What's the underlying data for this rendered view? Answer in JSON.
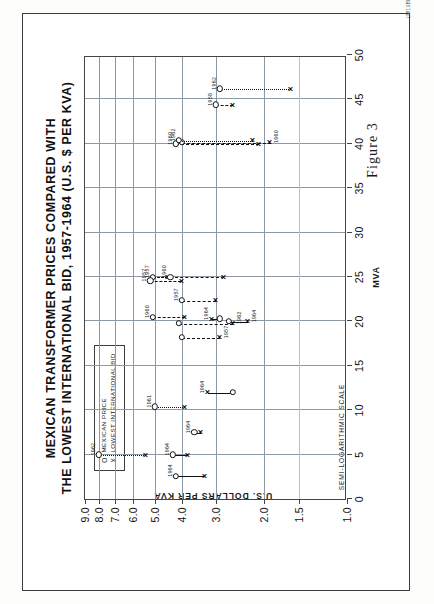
{
  "figure": {
    "caption": "Figure 3",
    "plate_code": "(281)IBRD-3478",
    "note": "SEMI-LOGARITHMIC SCALE"
  },
  "chart_data": {
    "type": "scatter",
    "title": "MEXICAN TRANSFORMER PRICES COMPARED WITH",
    "title_line2": "THE LOWEST INTERNATIONAL BID, 1957-1964 (U.S. $ PER KVA)",
    "xlabel": "MVA",
    "ylabel": "U.S. DOLLARS PER KVA",
    "xlim": [
      0,
      50
    ],
    "ylim": [
      1.0,
      9.0
    ],
    "yscale": "log",
    "grid": true,
    "xticks": [
      0,
      5,
      10,
      15,
      20,
      25,
      30,
      35,
      40,
      45,
      50
    ],
    "xticklabels": [
      "0",
      "5",
      "10",
      "15",
      "20",
      "25",
      "30",
      "35",
      "40",
      "45",
      "50"
    ],
    "yticks": [
      1.0,
      1.5,
      2.0,
      3.0,
      4.0,
      5.0,
      6.0,
      7.0,
      8.0,
      9.0
    ],
    "yticklabels": [
      "1.0",
      "1.5",
      "2.0",
      "3.0",
      "4.0",
      "5.0",
      "6.0",
      "7.0",
      "8.0",
      "9.0"
    ],
    "legend": {
      "position": "upper-left-inset",
      "entries": [
        {
          "symbol": "O",
          "label": "MEXICAN PRICE"
        },
        {
          "symbol": "X",
          "label": "LOWEST INTERNATIONAL BID"
        }
      ]
    },
    "series": [
      {
        "name": "MEXICAN PRICE",
        "marker": "O"
      },
      {
        "name": "LOWEST INTERNATIONAL BID",
        "marker": "X"
      }
    ],
    "pairs": [
      {
        "year": "1962",
        "mva": 5.0,
        "mexican_price": 8.0,
        "lowest_bid": 5.4,
        "line": "dot",
        "label_side": "above"
      },
      {
        "year": "1964",
        "mva": 2.6,
        "mexican_price": 4.2,
        "lowest_bid": 3.3,
        "line": "solid",
        "label_side": "above"
      },
      {
        "year": "1964",
        "mva": 5.0,
        "mexican_price": 4.3,
        "lowest_bid": 3.8,
        "line": "solid",
        "label_side": "above"
      },
      {
        "year": "1964",
        "mva": 7.5,
        "mexican_price": 3.6,
        "lowest_bid": 3.4,
        "line": "solid",
        "label_side": "above"
      },
      {
        "year": "1961",
        "mva": 10.4,
        "mexican_price": 5.0,
        "lowest_bid": 3.9,
        "line": "dot",
        "label_side": "above"
      },
      {
        "year": "1964",
        "mva": 12.0,
        "mexican_price": 2.6,
        "lowest_bid": 3.2,
        "line": "solid",
        "label_side": "above"
      },
      {
        "year": "1957",
        "mva": 18.2,
        "mexican_price": 4.0,
        "lowest_bid": 2.9,
        "line": "dash",
        "label_side": "below"
      },
      {
        "year": "1962",
        "mva": 19.8,
        "mexican_price": 4.1,
        "lowest_bid": 2.6,
        "line": "dash",
        "label_side": "below"
      },
      {
        "year": "1960",
        "mva": 20.5,
        "mexican_price": 5.1,
        "lowest_bid": 3.9,
        "line": "dash",
        "label_side": "above"
      },
      {
        "year": "1964",
        "mva": 20.3,
        "mexican_price": 2.9,
        "lowest_bid": 3.1,
        "line": "solid",
        "label_side": "above"
      },
      {
        "year": "1964",
        "mva": 20.0,
        "mexican_price": 2.7,
        "lowest_bid": 2.3,
        "line": "solid",
        "label_side": "below"
      },
      {
        "year": "1957",
        "mva": 22.4,
        "mexican_price": 4.0,
        "lowest_bid": 3.0,
        "line": "dash",
        "label_side": "above"
      },
      {
        "year": "1957",
        "mva": 25.0,
        "mexican_price": 5.1,
        "lowest_bid": 4.5,
        "line": "dash",
        "label_side": "above"
      },
      {
        "year": "1957",
        "mva": 24.6,
        "mexican_price": 5.2,
        "lowest_bid": 4.0,
        "line": "dash",
        "label_side": "above"
      },
      {
        "year": "1960",
        "mva": 25.0,
        "mexican_price": 4.4,
        "lowest_bid": 2.8,
        "line": "dash",
        "label_side": "above"
      },
      {
        "year": "1960",
        "mva": 40.0,
        "mexican_price": 4.2,
        "lowest_bid": 2.1,
        "line": "dash",
        "label_side": "above"
      },
      {
        "year": "1960",
        "mva": 40.2,
        "mexican_price": 4.0,
        "lowest_bid": 1.9,
        "line": "dash",
        "label_side": "below"
      },
      {
        "year": "1962",
        "mva": 40.4,
        "mexican_price": 4.1,
        "lowest_bid": 2.2,
        "line": "dot",
        "label_side": "above"
      },
      {
        "year": "1958",
        "mva": 44.4,
        "mexican_price": 3.0,
        "lowest_bid": 2.6,
        "line": "dash",
        "label_side": "above"
      },
      {
        "year": "1962",
        "mva": 46.2,
        "mexican_price": 2.9,
        "lowest_bid": 1.6,
        "line": "dot",
        "label_side": "above"
      }
    ]
  }
}
